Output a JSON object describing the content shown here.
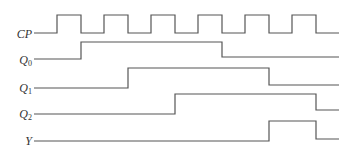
{
  "diagram": {
    "type": "timing-diagram",
    "signals": [
      {
        "name": "CP",
        "label_main": "CP",
        "label_sub": "",
        "label_y": 27,
        "waveform": "clock",
        "points": [
          [
            34,
            33
          ],
          [
            57,
            33
          ],
          [
            57,
            15
          ],
          [
            81,
            15
          ],
          [
            81,
            33
          ],
          [
            104,
            33
          ],
          [
            104,
            15
          ],
          [
            128,
            15
          ],
          [
            128,
            33
          ],
          [
            151,
            33
          ],
          [
            151,
            15
          ],
          [
            175,
            15
          ],
          [
            175,
            33
          ],
          [
            198,
            33
          ],
          [
            198,
            15
          ],
          [
            222,
            15
          ],
          [
            222,
            33
          ],
          [
            245,
            33
          ],
          [
            245,
            15
          ],
          [
            269,
            15
          ],
          [
            269,
            33
          ],
          [
            292,
            33
          ],
          [
            292,
            15
          ],
          [
            316,
            15
          ],
          [
            316,
            33
          ],
          [
            339,
            33
          ]
        ]
      },
      {
        "name": "Q0",
        "label_main": "Q",
        "label_sub": "0",
        "label_y": 53,
        "points": [
          [
            34,
            59
          ],
          [
            81,
            59
          ],
          [
            81,
            42
          ],
          [
            222,
            42
          ],
          [
            222,
            57
          ],
          [
            339,
            57
          ]
        ]
      },
      {
        "name": "Q1",
        "label_main": "Q",
        "label_sub": "1",
        "label_y": 81,
        "points": [
          [
            34,
            88
          ],
          [
            128,
            88
          ],
          [
            128,
            68
          ],
          [
            269,
            68
          ],
          [
            269,
            85
          ],
          [
            339,
            85
          ]
        ]
      },
      {
        "name": "Q2",
        "label_main": "Q",
        "label_sub": "2",
        "label_y": 107,
        "points": [
          [
            34,
            114
          ],
          [
            175,
            114
          ],
          [
            175,
            94
          ],
          [
            316,
            94
          ],
          [
            316,
            110
          ],
          [
            339,
            110
          ]
        ]
      },
      {
        "name": "Y",
        "label_main": "Y",
        "label_sub": "",
        "label_y": 134,
        "points": [
          [
            34,
            141
          ],
          [
            269,
            141
          ],
          [
            269,
            121
          ],
          [
            316,
            121
          ],
          [
            316,
            139
          ],
          [
            339,
            139
          ]
        ]
      }
    ],
    "clock_pulses": 6,
    "stroke_color": "#555555",
    "background": "#ffffff"
  }
}
